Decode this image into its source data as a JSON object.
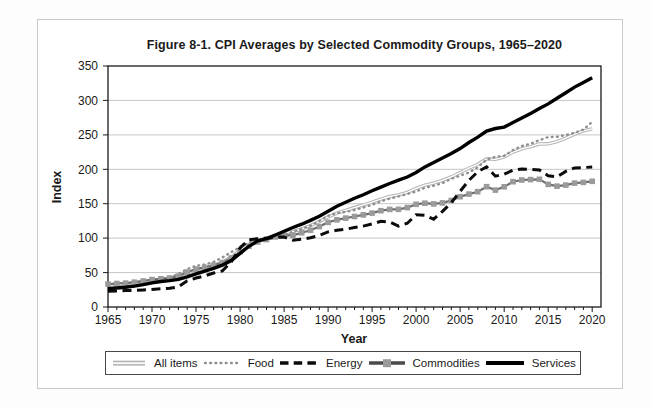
{
  "figure": {
    "title": "Figure 8-1. CPI Averages by Selected Commodity Groups, 1965–2020"
  },
  "chart_data": {
    "type": "line",
    "title": "Figure 8-1. CPI Averages by Selected Commodity Groups, 1965–2020",
    "xlabel": "Year",
    "ylabel": "Index",
    "xlim": [
      1965,
      2021
    ],
    "ylim": [
      0,
      350
    ],
    "x_ticks": [
      1965,
      1970,
      1975,
      1980,
      1985,
      1990,
      1995,
      2000,
      2005,
      2010,
      2015,
      2020
    ],
    "x_minor_tick_interval": 1,
    "y_ticks": [
      0,
      50,
      100,
      150,
      200,
      250,
      300,
      350
    ],
    "grid": "horizontal",
    "grid_color": "#c6c6c6",
    "axis_color": "#1a1a1a",
    "legend_position": "bottom",
    "x": [
      1965,
      1966,
      1967,
      1968,
      1969,
      1970,
      1971,
      1972,
      1973,
      1974,
      1975,
      1976,
      1977,
      1978,
      1979,
      1980,
      1981,
      1982,
      1983,
      1984,
      1985,
      1986,
      1987,
      1988,
      1989,
      1990,
      1991,
      1992,
      1993,
      1994,
      1995,
      1996,
      1997,
      1998,
      1999,
      2000,
      2001,
      2002,
      2003,
      2004,
      2005,
      2006,
      2007,
      2008,
      2009,
      2010,
      2011,
      2012,
      2013,
      2014,
      2015,
      2016,
      2017,
      2018,
      2019,
      2020
    ],
    "series": [
      {
        "name": "All items",
        "style": "double",
        "color": "#b5b5b5",
        "values": [
          31.5,
          32.4,
          33.4,
          34.8,
          36.7,
          38.8,
          40.5,
          41.8,
          44.4,
          49.3,
          53.8,
          56.9,
          60.6,
          65.2,
          72.6,
          82.4,
          90.9,
          96.5,
          99.6,
          103.9,
          107.6,
          109.6,
          113.6,
          118.3,
          124.0,
          130.7,
          136.2,
          140.3,
          144.5,
          148.2,
          152.4,
          156.9,
          160.5,
          163.0,
          166.6,
          172.2,
          177.1,
          179.9,
          184.0,
          188.9,
          195.3,
          201.6,
          207.3,
          215.3,
          214.5,
          218.1,
          224.9,
          229.6,
          233.0,
          236.7,
          237.0,
          240.0,
          245.1,
          251.1,
          255.7,
          258.8
        ]
      },
      {
        "name": "Food",
        "style": "dotted",
        "color": "#8f8f8f",
        "values": [
          32.2,
          33.8,
          34.1,
          35.3,
          37.1,
          39.2,
          40.4,
          42.1,
          48.2,
          55.1,
          59.8,
          61.6,
          65.5,
          72.0,
          79.9,
          86.8,
          93.6,
          97.4,
          99.4,
          103.2,
          105.6,
          109.0,
          113.5,
          118.2,
          125.1,
          132.4,
          136.3,
          137.9,
          140.9,
          144.3,
          148.4,
          153.3,
          157.3,
          160.7,
          164.1,
          167.8,
          173.1,
          176.2,
          180.0,
          186.2,
          190.7,
          195.2,
          202.9,
          214.1,
          218.0,
          219.6,
          227.8,
          233.8,
          237.0,
          242.4,
          246.8,
          247.3,
          249.6,
          252.9,
          257.6,
          268.8
        ]
      },
      {
        "name": "Energy",
        "style": "dashed",
        "color": "#0b0b0b",
        "values": [
          22.9,
          23.3,
          23.8,
          24.2,
          24.8,
          25.5,
          26.5,
          27.2,
          29.4,
          38.1,
          42.1,
          45.1,
          49.4,
          52.5,
          65.7,
          86.0,
          97.7,
          99.2,
          99.9,
          100.9,
          101.6,
          97.0,
          98.5,
          100.5,
          104.0,
          109.0,
          111.5,
          113.0,
          115.5,
          117.5,
          120.5,
          124.5,
          123.5,
          117.5,
          121.5,
          134.0,
          133.0,
          127.5,
          139.0,
          151.5,
          168.0,
          184.0,
          196.5,
          203.5,
          190.0,
          193.0,
          198.5,
          200.5,
          200.0,
          199.0,
          190.5,
          189.0,
          197.0,
          202.0,
          202.5,
          203.5
        ]
      },
      {
        "name": "Commodities",
        "style": "squares",
        "color": "#6e6e6e",
        "marker_color": "#9a9a9a",
        "values": [
          33.2,
          34.1,
          34.7,
          36.0,
          37.7,
          39.8,
          40.9,
          42.1,
          44.8,
          50.7,
          55.1,
          57.5,
          60.5,
          64.5,
          71.2,
          80.5,
          88.3,
          94.4,
          97.9,
          101.8,
          104.4,
          104.2,
          107.7,
          111.5,
          116.7,
          122.8,
          126.6,
          129.1,
          131.5,
          133.8,
          136.4,
          139.9,
          141.8,
          141.9,
          144.4,
          149.2,
          150.7,
          149.7,
          151.2,
          154.7,
          160.2,
          164.0,
          167.5,
          174.7,
          169.8,
          174.6,
          182.0,
          184.5,
          185.0,
          185.5,
          178.0,
          175.5,
          177.0,
          180.0,
          181.0,
          182.5
        ]
      },
      {
        "name": "Services",
        "style": "solid",
        "color": "#000000",
        "values": [
          26.6,
          27.6,
          28.8,
          30.3,
          32.4,
          35.0,
          37.0,
          38.4,
          40.1,
          43.8,
          48.0,
          52.0,
          56.0,
          60.8,
          67.5,
          77.9,
          88.1,
          96.0,
          99.4,
          104.6,
          109.9,
          115.4,
          120.2,
          125.7,
          131.9,
          139.2,
          146.3,
          152.0,
          157.9,
          163.1,
          168.7,
          174.1,
          179.4,
          184.2,
          188.8,
          195.3,
          203.4,
          209.8,
          216.5,
          222.8,
          230.1,
          238.9,
          246.8,
          255.5,
          259.2,
          261.3,
          267.8,
          274.4,
          281.2,
          288.3,
          295.0,
          303.2,
          311.2,
          319.4,
          326.0,
          333.0
        ]
      }
    ]
  }
}
